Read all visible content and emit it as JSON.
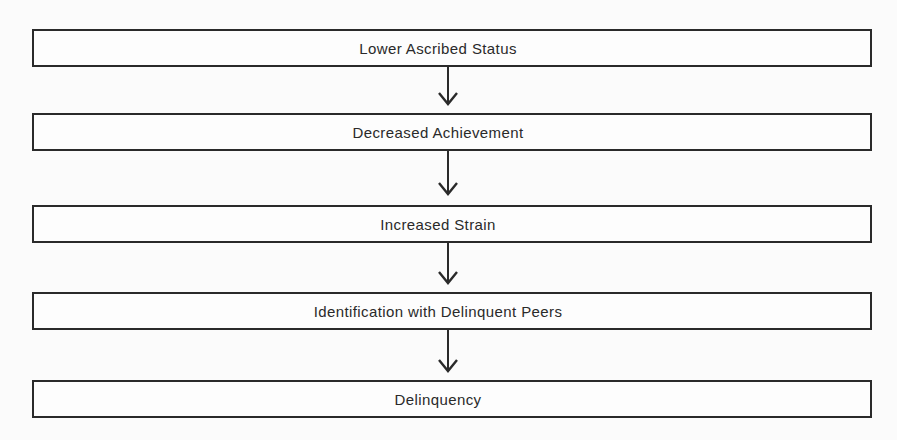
{
  "diagram": {
    "type": "flowchart",
    "direction": "top-to-bottom",
    "nodes": [
      {
        "id": "n1",
        "label": "Lower Ascribed Status"
      },
      {
        "id": "n2",
        "label": "Decreased Achievement"
      },
      {
        "id": "n3",
        "label": "Increased Strain"
      },
      {
        "id": "n4",
        "label": "Identification with Delinquent Peers"
      },
      {
        "id": "n5",
        "label": "Delinquency"
      }
    ],
    "edges": [
      {
        "from": "n1",
        "to": "n2",
        "icon": "arrow-down-icon"
      },
      {
        "from": "n2",
        "to": "n3",
        "icon": "arrow-down-icon"
      },
      {
        "from": "n3",
        "to": "n4",
        "icon": "arrow-down-icon"
      },
      {
        "from": "n4",
        "to": "n5",
        "icon": "arrow-down-icon"
      }
    ],
    "colors": {
      "stroke": "#2a2a2a",
      "background": "#fbfbfb"
    }
  }
}
